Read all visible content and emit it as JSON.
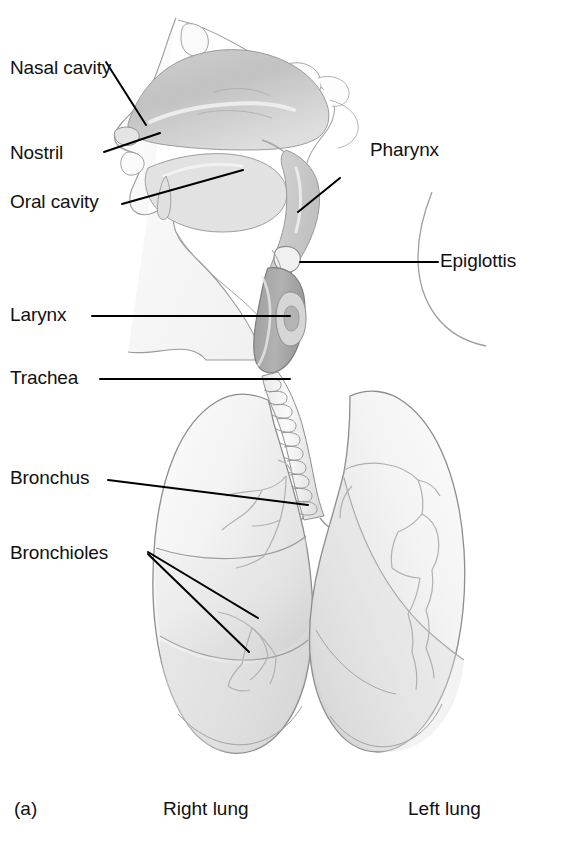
{
  "figure": {
    "panel_id": "(a)"
  },
  "labels": {
    "nasal_cavity": "Nasal cavity",
    "nostril": "Nostril",
    "oral_cavity": "Oral cavity",
    "larynx": "Larynx",
    "trachea": "Trachea",
    "bronchus": "Bronchus",
    "bronchioles": "Bronchioles",
    "pharynx": "Pharynx",
    "epiglottis": "Epiglottis",
    "right_lung": "Right lung",
    "left_lung": "Left lung"
  },
  "colors": {
    "background": "#ffffff",
    "text": "#111111",
    "leader_line": "#000000",
    "outline": "#8a8a8a",
    "outline_dark": "#5a5a5a",
    "tissue_light": "#f2f2f2",
    "tissue_mid": "#dcdcdc",
    "tissue_dark": "#b9b9b9",
    "cavity_gray": "#c9c9c9",
    "larynx_gray": "#a8a8a8",
    "lung_fill": "#f6f6f6",
    "lung_shade": "#d9d9d9"
  }
}
